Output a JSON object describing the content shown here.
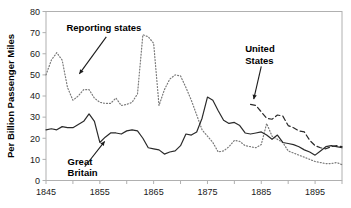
{
  "chart_data": {
    "type": "line",
    "title": "",
    "xlabel": "",
    "ylabel": "Per Billion Passenger Miles",
    "xlim": [
      1845,
      1900
    ],
    "ylim": [
      0,
      80
    ],
    "yticks": [
      0,
      10,
      20,
      30,
      40,
      50,
      60,
      70,
      80
    ],
    "xticks": [
      1845,
      1855,
      1865,
      1875,
      1885,
      1895
    ],
    "xminor_step": 5,
    "grid": false,
    "legend": "annotations",
    "series": [
      {
        "name": "Reporting states",
        "style": "dotted",
        "color": "#7a7a7a",
        "x": [
          1845,
          1846,
          1847,
          1848,
          1849,
          1850,
          1851,
          1852,
          1853,
          1854,
          1855,
          1856,
          1857,
          1858,
          1859,
          1860,
          1861,
          1862,
          1863,
          1864,
          1865,
          1866,
          1867,
          1868,
          1869,
          1870,
          1871,
          1872,
          1873,
          1874,
          1875,
          1876,
          1877,
          1878,
          1879,
          1880,
          1881,
          1882,
          1883,
          1884,
          1885,
          1886,
          1887,
          1888,
          1889,
          1890,
          1891,
          1892,
          1893,
          1894,
          1895,
          1896,
          1897,
          1898,
          1899,
          1900
        ],
        "values": [
          50,
          57,
          60.5,
          57,
          44,
          38,
          40,
          43,
          43,
          39,
          37,
          36.5,
          36.5,
          39,
          35.5,
          36,
          37,
          41,
          69,
          68,
          65,
          35.5,
          43,
          48,
          50,
          49.5,
          44,
          38,
          31,
          24,
          21,
          18,
          13.5,
          14,
          16,
          19,
          18.5,
          16.5,
          16,
          15.5,
          17,
          27,
          21,
          19.5,
          18,
          14,
          13,
          12,
          11,
          10,
          9,
          8.5,
          8,
          8,
          8.5,
          7.5
        ]
      },
      {
        "name": "Great Britain",
        "style": "solid",
        "color": "#2a2a2a",
        "x": [
          1845,
          1846,
          1847,
          1848,
          1849,
          1850,
          1851,
          1852,
          1853,
          1854,
          1855,
          1856,
          1857,
          1858,
          1859,
          1860,
          1861,
          1862,
          1863,
          1864,
          1865,
          1866,
          1867,
          1868,
          1869,
          1870,
          1871,
          1872,
          1873,
          1874,
          1875,
          1876,
          1877,
          1878,
          1879,
          1880,
          1881,
          1882,
          1883,
          1884,
          1885,
          1886,
          1887,
          1888,
          1889,
          1890,
          1891,
          1892,
          1893,
          1894,
          1895,
          1896,
          1897,
          1898,
          1899,
          1900
        ],
        "values": [
          24,
          24.5,
          24,
          25.5,
          25,
          25,
          26.5,
          28,
          31.5,
          28,
          18,
          20.5,
          22.5,
          22.5,
          22,
          23.5,
          24,
          23.5,
          20,
          15.5,
          15,
          14.5,
          12.5,
          13.5,
          14,
          16.5,
          22,
          21.5,
          23,
          29.5,
          39.5,
          38,
          33,
          28.5,
          27,
          27.5,
          26,
          22.5,
          22,
          22.5,
          23,
          21.5,
          19.5,
          21.5,
          18,
          17.5,
          17,
          16,
          14.5,
          13.5,
          12,
          14,
          16,
          16.5,
          16,
          15.5
        ]
      },
      {
        "name": "United States",
        "style": "dashed",
        "color": "#2a2a2a",
        "x": [
          1883,
          1884,
          1885,
          1886,
          1887,
          1888,
          1889,
          1890,
          1891,
          1892,
          1893,
          1894,
          1895,
          1896,
          1897,
          1898,
          1899,
          1900
        ],
        "values": [
          36,
          35.5,
          32.5,
          29.5,
          29,
          31,
          30.5,
          26,
          25,
          23.5,
          23,
          19,
          16.5,
          15.5,
          15,
          16,
          16.5,
          16
        ]
      }
    ],
    "annotations": [
      {
        "name": "reporting-states-label",
        "text": "Reporting states",
        "x": 1848.8,
        "y": 72.5
      },
      {
        "name": "united-states-label-line1",
        "text": "United",
        "x": 1882.0,
        "y": 62.5
      },
      {
        "name": "united-states-label-line2",
        "text": "States",
        "x": 1882.0,
        "y": 56.5
      },
      {
        "name": "great-britain-label-line1",
        "text": "Great",
        "x": 1849.0,
        "y": 9.0
      },
      {
        "name": "great-britain-label-line2",
        "text": "Britain",
        "x": 1849.0,
        "y": 3.5
      }
    ]
  },
  "axes": {
    "ylabel": "Per Billion Passenger Miles",
    "ytick_labels": [
      "0",
      "10",
      "20",
      "30",
      "40",
      "50",
      "60",
      "70",
      "80"
    ],
    "xtick_labels": [
      "1845",
      "1855",
      "1865",
      "1875",
      "1885",
      "1895"
    ]
  },
  "colors": {
    "frame": "#b0b0b0",
    "solid_series": "#2a2a2a",
    "dotted_series": "#7a7a7a",
    "dashed_series": "#2a2a2a",
    "text": "#1a1a1a",
    "background": "#ffffff"
  }
}
